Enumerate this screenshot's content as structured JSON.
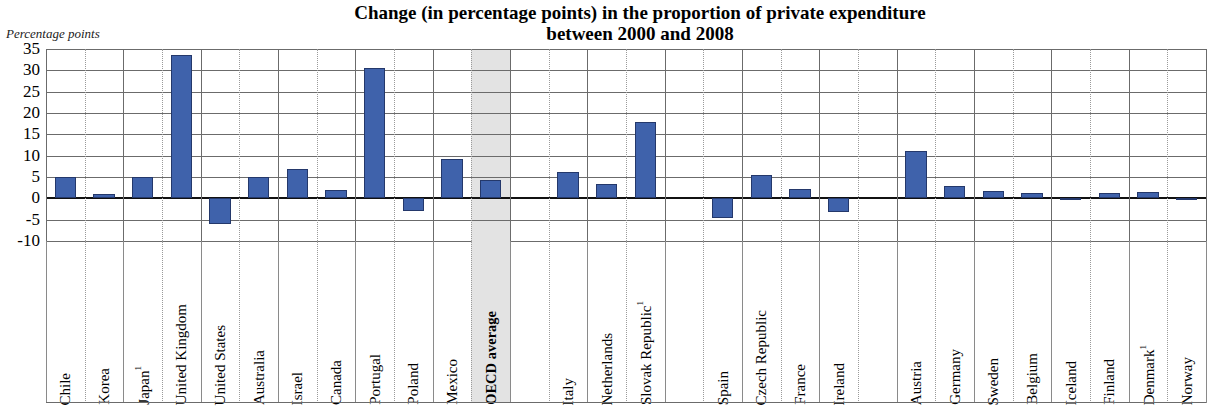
{
  "title": "Change (in percentage points) in the proportion of private expenditure between 2000 and 2008",
  "title_line1": "Change (in percentage points) in the proportion of private expenditure",
  "title_line2": "between 2000 and 2008",
  "axis_unit_label": "Percentage points",
  "colors": {
    "bar_fill": "#3f62ab",
    "bar_stroke": "#24386b",
    "grid": "#6b6b6b",
    "zero_line": "#111111",
    "highlight_band": "#e3e3e3",
    "background": "#ffffff"
  },
  "chart_data": {
    "type": "bar",
    "title": "Change (in percentage points) in the proportion of private expenditure between 2000 and 2008",
    "xlabel": "",
    "ylabel": "Percentage points",
    "ylim": [
      -10,
      35
    ],
    "yticks": [
      35,
      30,
      25,
      20,
      15,
      10,
      5,
      0,
      -5,
      -10
    ],
    "ytick_labels": [
      "35",
      "30",
      "25",
      "20",
      "15",
      "10",
      "5",
      "0",
      "-5",
      "-10"
    ],
    "grid": true,
    "legend": "none",
    "highlighted_category": "OECD average",
    "categories": [
      "Chile",
      "Korea",
      "Japan¹",
      "United Kingdom",
      "United States",
      "Australia",
      "Israel",
      "Canada",
      "Portugal",
      "Poland",
      "Mexico",
      "OECD average",
      "",
      "Italy",
      "Netherlands",
      "Slovak Republic¹",
      "",
      "Spain",
      "Czech Republic",
      "France",
      "Ireland",
      "",
      "Austria",
      "Germany",
      "Sweden",
      "Belgium",
      "Iceland",
      "Finland",
      "Denmark¹",
      "Norway"
    ],
    "values": [
      5.0,
      1.0,
      5.0,
      33.5,
      -6.0,
      5.0,
      6.8,
      2.0,
      30.5,
      -3.0,
      9.2,
      4.2,
      null,
      6.2,
      3.4,
      18.0,
      null,
      -4.5,
      5.5,
      2.2,
      -3.2,
      null,
      11.0,
      2.8,
      1.7,
      1.2,
      -0.2,
      1.3,
      1.6,
      -0.5
    ]
  },
  "footnote_marker": "1"
}
